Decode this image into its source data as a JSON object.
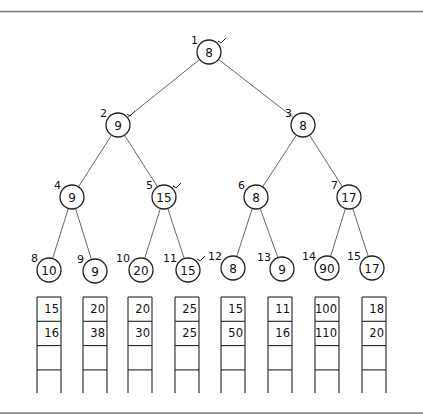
{
  "diagram": {
    "type": "tournament-tree-with-run-buffers",
    "nodes": [
      {
        "index": "1",
        "value": "8",
        "x": 209,
        "y": 52,
        "checked": true
      },
      {
        "index": "2",
        "value": "9",
        "x": 118,
        "y": 125,
        "checked": true
      },
      {
        "index": "3",
        "value": "8",
        "x": 303,
        "y": 125,
        "checked": false
      },
      {
        "index": "4",
        "value": "9",
        "x": 72,
        "y": 197,
        "checked": false
      },
      {
        "index": "5",
        "value": "15",
        "x": 164,
        "y": 197,
        "checked": true
      },
      {
        "index": "6",
        "value": "8",
        "x": 256,
        "y": 197,
        "checked": false
      },
      {
        "index": "7",
        "value": "17",
        "x": 349,
        "y": 197,
        "checked": false
      },
      {
        "index": "8",
        "value": "10",
        "x": 49,
        "y": 270,
        "checked": false
      },
      {
        "index": "9",
        "value": "9",
        "x": 95,
        "y": 271,
        "checked": false
      },
      {
        "index": "10",
        "value": "20",
        "x": 141,
        "y": 270,
        "checked": false
      },
      {
        "index": "11",
        "value": "15",
        "x": 188,
        "y": 270,
        "checked": true
      },
      {
        "index": "12",
        "value": "8",
        "x": 233,
        "y": 268,
        "checked": false
      },
      {
        "index": "13",
        "value": "9",
        "x": 282,
        "y": 269,
        "checked": false
      },
      {
        "index": "14",
        "value": "90",
        "x": 327,
        "y": 268,
        "checked": false
      },
      {
        "index": "15",
        "value": "17",
        "x": 372,
        "y": 268,
        "checked": false
      }
    ],
    "edges": [
      [
        1,
        2
      ],
      [
        1,
        3
      ],
      [
        2,
        4
      ],
      [
        2,
        5
      ],
      [
        3,
        6
      ],
      [
        3,
        7
      ],
      [
        4,
        8
      ],
      [
        4,
        9
      ],
      [
        5,
        10
      ],
      [
        5,
        11
      ],
      [
        6,
        12
      ],
      [
        6,
        13
      ],
      [
        7,
        14
      ],
      [
        7,
        15
      ]
    ],
    "columns": [
      {
        "x": 37,
        "cells": [
          "15",
          "16",
          "",
          ""
        ]
      },
      {
        "x": 83,
        "cells": [
          "20",
          "38",
          "",
          ""
        ]
      },
      {
        "x": 128,
        "cells": [
          "20",
          "30",
          "",
          ""
        ]
      },
      {
        "x": 175,
        "cells": [
          "25",
          "25",
          "",
          ""
        ]
      },
      {
        "x": 221,
        "cells": [
          "15",
          "50",
          "",
          ""
        ]
      },
      {
        "x": 268,
        "cells": [
          "11",
          "16",
          "",
          ""
        ]
      },
      {
        "x": 315,
        "cells": [
          "100",
          "110",
          "",
          ""
        ]
      },
      {
        "x": 362,
        "cells": [
          "18",
          "20",
          "",
          ""
        ]
      }
    ]
  }
}
